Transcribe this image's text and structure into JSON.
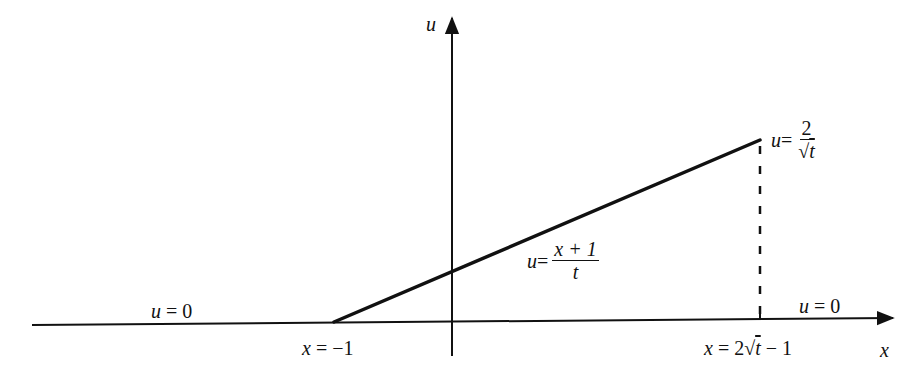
{
  "diagram": {
    "axes": {
      "horizontal_label": "x",
      "vertical_label": "u"
    },
    "labels": {
      "left_zero": {
        "lhs": "u",
        "eq": " = ",
        "rhs": "0"
      },
      "right_zero": {
        "lhs": "u",
        "eq": " = ",
        "rhs": "0"
      },
      "left_endpoint": {
        "lhs": "x",
        "eq": " = ",
        "rhs": "−1"
      },
      "right_endpoint": {
        "lhs": "x",
        "eq": " = 2√",
        "var": "t",
        "rest": " − 1"
      },
      "ramp": {
        "lhs": "u",
        "eq": " =",
        "num": "x + 1",
        "den": "t"
      },
      "peak": {
        "lhs": "u",
        "eq": " =",
        "num": "2",
        "den_root": "√",
        "den_var": "t"
      }
    },
    "segments": [
      {
        "name": "zero-region-left",
        "from_x": "-∞",
        "to_x": "-1",
        "u": "0",
        "style": "solid"
      },
      {
        "name": "ramp",
        "from_x": "-1",
        "to_x": "2√t − 1",
        "u": "(x + 1)/t",
        "style": "solid"
      },
      {
        "name": "shock-drop",
        "at_x": "2√t − 1",
        "from_u": "2/√t",
        "to_u": "0",
        "style": "dashed"
      },
      {
        "name": "zero-region-right",
        "from_x": "2√t − 1",
        "to_x": "∞",
        "u": "0",
        "style": "solid"
      }
    ],
    "colors": {
      "ink": "#111111",
      "background": "#ffffff"
    }
  }
}
